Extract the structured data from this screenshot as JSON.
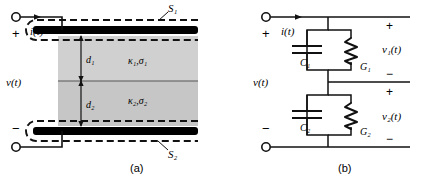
{
  "figure": {
    "panels": [
      {
        "id": "a",
        "caption": "(a)",
        "title": "parallel-plate capacitor with two lossy dielectric layers",
        "labels": {
          "current": "i(t)",
          "voltage": "v(t)",
          "plus": "+",
          "minus": "−",
          "surface_top": "S₁",
          "surface_bottom": "S₂",
          "thickness_1": "d₁",
          "thickness_2": "d₂",
          "material_1": "κ₁,σ₁",
          "material_2": "κ₂,σ₂"
        }
      },
      {
        "id": "b",
        "caption": "(b)",
        "title": "equivalent circuit",
        "labels": {
          "current": "i(t)",
          "voltage": "v(t)",
          "plus": "+",
          "minus": "−",
          "cap_1": "C₁",
          "cap_2": "C₂",
          "cond_1": "G₁",
          "cond_2": "G₂",
          "v1": "v₁(t)",
          "v2": "v₂(t)",
          "plus_1": "+",
          "minus_1": "−",
          "plus_2": "+",
          "minus_2": "−"
        }
      }
    ],
    "colors": {
      "line": "#1a1a1a",
      "plate": "#000000",
      "dielectric_1": "#cfcfcf",
      "dielectric_2": "#c4c4c4",
      "background": "#ffffff"
    }
  }
}
